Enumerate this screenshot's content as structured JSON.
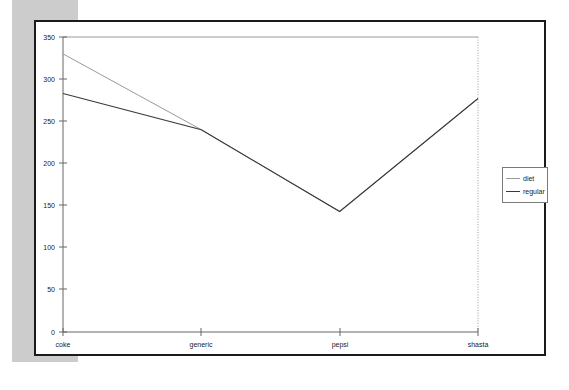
{
  "chart_data": {
    "type": "line",
    "title": "",
    "xlabel": "",
    "ylabel": "",
    "categories": [
      "coke",
      "generic",
      "pepsi",
      "shasta"
    ],
    "series": [
      {
        "name": "diet",
        "color": "#9a9a9a",
        "values": [
          330,
          240,
          143,
          277
        ]
      },
      {
        "name": "regular",
        "color": "#3a3a3a",
        "values": [
          283,
          240,
          143,
          277
        ]
      }
    ],
    "ylim": [
      0,
      350
    ],
    "yticks": [
      0,
      50,
      100,
      150,
      200,
      250,
      300,
      350
    ],
    "ytick_labels": [
      "0",
      "50",
      "100",
      "150",
      "200",
      "250",
      "300",
      "350"
    ],
    "xtick_labels": [
      "coke",
      "generic",
      "pepsi",
      "shasta"
    ],
    "grid": false,
    "legend": {
      "position": "right-outside",
      "entries": [
        "diet",
        "regular"
      ]
    }
  },
  "legend": {
    "entries": [
      {
        "label": "diet"
      },
      {
        "label": "regular"
      }
    ]
  },
  "axis": {
    "y_labels": [
      "350",
      "300",
      "250",
      "200",
      "150",
      "100",
      "50",
      "0"
    ],
    "x_labels": [
      "coke",
      "generic",
      "pepsi",
      "shasta"
    ]
  },
  "colors": {
    "diet": "#9a9a9a",
    "regular": "#3a3a3a",
    "page": "#ffffff",
    "card_border": "#1a1a1a",
    "shadow_band": "#c8c8c8"
  }
}
